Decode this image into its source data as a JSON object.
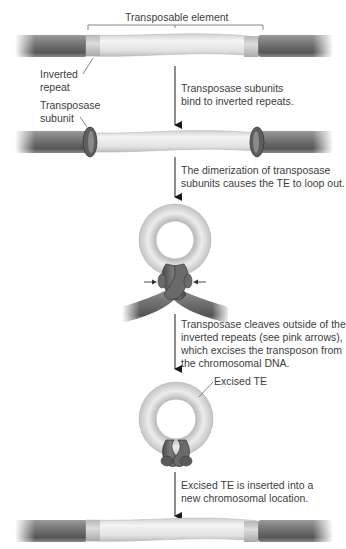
{
  "diagram": {
    "colors": {
      "chromosomal_dna": "#6e6e6e",
      "transposon": "#e6e6e6",
      "inverted_repeat": "#cfcfcf",
      "transposase": "#5a5a5a",
      "arrow": "#1a1a1a",
      "text": "#3d3d3d"
    },
    "labels": {
      "transposable_element": "Transposable element",
      "inverted_repeat_line1": "Inverted",
      "inverted_repeat_line2": "repeat",
      "transposase_subunit_line1": "Transposase",
      "transposase_subunit_line2": "subunit",
      "excised_te": "Excised TE"
    },
    "steps": [
      {
        "line1": "Transposase subunits",
        "line2": "bind to inverted repeats."
      },
      {
        "line1": "The dimerization of transposase",
        "line2": "subunits causes the TE to loop out."
      },
      {
        "line1": "Transposase cleaves outside of the",
        "line2": "inverted repeats (see pink arrows),",
        "line3": "which excises the transposon from",
        "line4": "the chromosomal DNA."
      },
      {
        "line1": "Excised TE is inserted into a",
        "line2": "new chromosomal location."
      }
    ]
  }
}
